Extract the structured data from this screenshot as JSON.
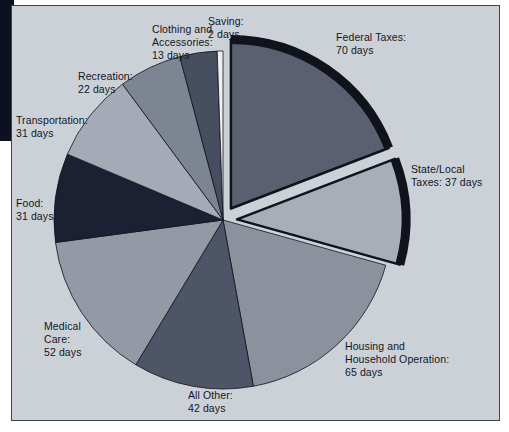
{
  "chart_data": {
    "type": "pie",
    "title": "",
    "unit": "days",
    "total_days": 365,
    "legend_position": "callout-labels",
    "categories": [
      "Federal Taxes",
      "State/Local Taxes",
      "Housing and Household Operation",
      "All Other",
      "Medical Care",
      "Food",
      "Transportation",
      "Recreation",
      "Clothing and Accessories",
      "Saving"
    ],
    "values": [
      70,
      37,
      65,
      42,
      52,
      31,
      31,
      22,
      13,
      2
    ],
    "slices": [
      {
        "name": "Federal Taxes",
        "label": "Federal Taxes:\n70 days",
        "days": 70,
        "color": "#5a6070",
        "exploded": true,
        "outlined": true
      },
      {
        "name": "State/Local Taxes",
        "label": "State/Local\nTaxes: 37 days",
        "days": 37,
        "color": "#a8aeb8",
        "exploded": true,
        "outlined": true
      },
      {
        "name": "Housing and Household Operation",
        "label": "Housing and\nHousehold Operation:\n65 days",
        "days": 65,
        "color": "#8b919d",
        "exploded": false,
        "outlined": false
      },
      {
        "name": "All Other",
        "label": "All Other:\n42 days",
        "days": 42,
        "color": "#4e5566",
        "exploded": false,
        "outlined": false
      },
      {
        "name": "Medical Care",
        "label": "Medical\nCare:\n52 days",
        "days": 52,
        "color": "#939aa6",
        "exploded": false,
        "outlined": false
      },
      {
        "name": "Food",
        "label": "Food:\n31 days",
        "days": 31,
        "color": "#1b2133",
        "exploded": false,
        "outlined": false
      },
      {
        "name": "Transportation",
        "label": "Transportation:\n31 days",
        "days": 31,
        "color": "#a5abb6",
        "exploded": false,
        "outlined": false
      },
      {
        "name": "Recreation",
        "label": "Recreation:\n22 days",
        "days": 22,
        "color": "#7e8592",
        "exploded": false,
        "outlined": false
      },
      {
        "name": "Clothing and Accessories",
        "label": "Clothing and\nAccessories:\n13 days",
        "days": 13,
        "color": "#474e60",
        "exploded": false,
        "outlined": false
      },
      {
        "name": "Saving",
        "label": "Saving:\n2 days",
        "days": 2,
        "color": "#eef0f2",
        "exploded": false,
        "outlined": false
      }
    ],
    "colors": {
      "panel_background": "#ccd1d8",
      "panel_border": "#3b4250",
      "page_background": "#ffffff",
      "slice_outline": "#10131c",
      "label_text": "#12161f"
    }
  }
}
